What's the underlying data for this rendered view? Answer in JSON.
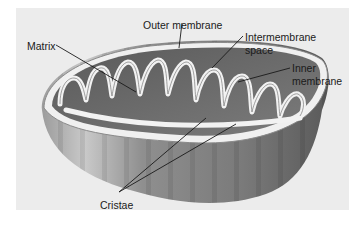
{
  "diagram": {
    "labels": {
      "outer_membrane": "Outer membrane",
      "matrix": "Matrix",
      "intermembrane_space_line1": "Intermembrane",
      "intermembrane_space_line2": "space",
      "inner_membrane_line1": "Inner",
      "inner_membrane_line2": "membrane",
      "cristae": "Cristae"
    },
    "colors": {
      "panel_background": "#ececec",
      "page_background": "#ffffff",
      "body_dark": "#6e6e6e",
      "body_mid": "#9a9a9a",
      "body_light": "#c8c8c8",
      "membrane": "#f2f2f2",
      "label_text": "#1a1a1a"
    }
  }
}
